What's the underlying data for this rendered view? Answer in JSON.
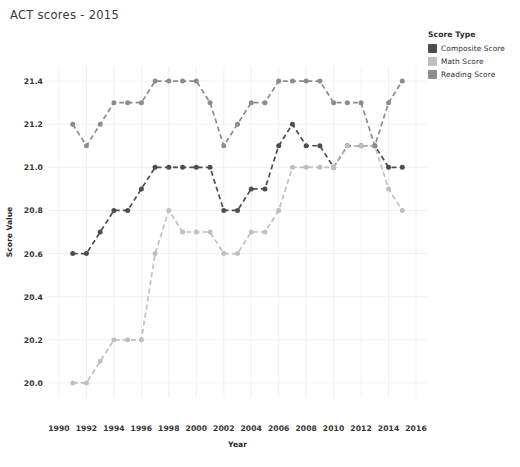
{
  "chart_title": "ACT scores - 2015",
  "axis": {
    "x_title": "Year",
    "y_title": "Score Value",
    "x_ticks": [
      "1990",
      "1992",
      "1994",
      "1996",
      "1998",
      "2000",
      "2002",
      "2004",
      "2006",
      "2008",
      "2010",
      "2012",
      "2014",
      "2016"
    ],
    "y_ticks": [
      "21.4",
      "21.2",
      "21.0",
      "20.8",
      "20.6",
      "20.4",
      "20.2",
      "20.0"
    ]
  },
  "legend": {
    "title": "Score Type",
    "items": [
      {
        "label": "Composite Score",
        "color": "#4d4d4d"
      },
      {
        "label": "Math Score",
        "color": "#bfbfbf"
      },
      {
        "label": "Reading Score",
        "color": "#8c8c8c"
      }
    ]
  },
  "footer_note": "",
  "chart_data": {
    "type": "line",
    "title": "ACT scores - 2015",
    "xlabel": "Year",
    "ylabel": "Score Value",
    "xlim": [
      1989.2,
      2016.8
    ],
    "ylim": [
      19.93,
      21.47
    ],
    "x_ticks": [
      1990,
      1992,
      1994,
      1996,
      1998,
      2000,
      2002,
      2004,
      2006,
      2008,
      2010,
      2012,
      2014,
      2016
    ],
    "y_ticks": [
      20.0,
      20.2,
      20.4,
      20.6,
      20.8,
      21.0,
      21.2,
      21.4
    ],
    "grid": true,
    "legend_position": "right",
    "line_style": "dashed",
    "markers": "circle",
    "x": [
      1991,
      1992,
      1993,
      1994,
      1995,
      1996,
      1997,
      1998,
      1999,
      2000,
      2001,
      2002,
      2003,
      2004,
      2005,
      2006,
      2007,
      2008,
      2009,
      2010,
      2011,
      2012,
      2013,
      2014,
      2015
    ],
    "series": [
      {
        "name": "Composite Score",
        "color": "#4d4d4d",
        "values": [
          20.6,
          20.6,
          20.7,
          20.8,
          20.8,
          20.9,
          21.0,
          21.0,
          21.0,
          21.0,
          21.0,
          20.8,
          20.8,
          20.9,
          20.9,
          21.1,
          21.2,
          21.1,
          21.1,
          21.0,
          21.1,
          21.1,
          21.1,
          21.0,
          21.0
        ]
      },
      {
        "name": "Math Score",
        "color": "#bfbfbf",
        "values": [
          20.0,
          20.0,
          20.1,
          20.2,
          20.2,
          20.2,
          20.6,
          20.8,
          20.7,
          20.7,
          20.7,
          20.6,
          20.6,
          20.7,
          20.7,
          20.8,
          21.0,
          21.0,
          21.0,
          21.0,
          21.1,
          21.1,
          21.1,
          20.9,
          20.8
        ]
      },
      {
        "name": "Reading Score",
        "color": "#8c8c8c",
        "values": [
          21.2,
          21.1,
          21.2,
          21.3,
          21.3,
          21.3,
          21.4,
          21.4,
          21.4,
          21.4,
          21.3,
          21.1,
          21.2,
          21.3,
          21.3,
          21.4,
          21.4,
          21.4,
          21.4,
          21.3,
          21.3,
          21.3,
          21.1,
          21.3,
          21.4
        ]
      }
    ]
  }
}
